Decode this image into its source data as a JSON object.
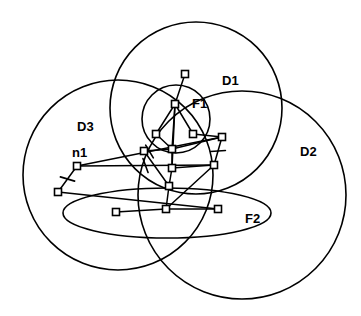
{
  "figure": {
    "width": 361,
    "height": 316,
    "background_color": "#ffffff",
    "stroke_color": "#000000"
  },
  "regions": [
    {
      "id": "D1",
      "label": "D1",
      "shape": "circle",
      "cx": 196,
      "cy": 108,
      "r": 86,
      "label_x": 222,
      "label_y": 82
    },
    {
      "id": "D2",
      "label": "D2",
      "shape": "circle",
      "cx": 242,
      "cy": 195,
      "r": 104,
      "label_x": 300,
      "label_y": 153
    },
    {
      "id": "D3",
      "label": "D3",
      "shape": "circle",
      "cx": 118,
      "cy": 175,
      "r": 95,
      "label_x": 77,
      "label_y": 128
    }
  ],
  "sub_regions": [
    {
      "id": "F1",
      "label": "F1",
      "shape": "circle",
      "cx": 176,
      "cy": 119,
      "r": 34,
      "label_x": 192,
      "label_y": 105
    },
    {
      "id": "F2",
      "label": "F2",
      "shape": "ellipse",
      "cx": 167,
      "cy": 213,
      "rx": 104,
      "ry": 25,
      "label_x": 245,
      "label_y": 220
    }
  ],
  "nodes": [
    {
      "id": "n_top",
      "x": 185,
      "y": 74,
      "size": 7
    },
    {
      "id": "n1_hub",
      "x": 175,
      "y": 104,
      "size": 7
    },
    {
      "id": "n_l1",
      "x": 156,
      "y": 134,
      "size": 7
    },
    {
      "id": "n_r1",
      "x": 193,
      "y": 134,
      "size": 7
    },
    {
      "id": "n_c1",
      "x": 172,
      "y": 149,
      "size": 7
    },
    {
      "id": "n_far_r",
      "x": 222,
      "y": 137,
      "size": 7
    },
    {
      "id": "n_l2",
      "x": 144,
      "y": 151,
      "size": 7
    },
    {
      "id": "n_c2",
      "x": 172,
      "y": 168,
      "size": 7
    },
    {
      "id": "n_r2",
      "x": 214,
      "y": 165,
      "size": 7
    },
    {
      "id": "n1",
      "x": 77,
      "y": 166,
      "size": 7
    },
    {
      "id": "n_ll",
      "x": 58,
      "y": 192,
      "size": 7
    },
    {
      "id": "n_c3",
      "x": 169,
      "y": 186,
      "size": 7
    },
    {
      "id": "n_f2_l",
      "x": 116,
      "y": 212,
      "size": 7
    },
    {
      "id": "n_f2_c",
      "x": 166,
      "y": 209,
      "size": 7
    },
    {
      "id": "n_f2_r",
      "x": 218,
      "y": 209,
      "size": 7
    }
  ],
  "node_labels": [
    {
      "text": "n1",
      "x": 72,
      "y": 154
    }
  ],
  "edges": [
    {
      "from": "n_top",
      "to": "n1_hub",
      "ticks": 0
    },
    {
      "from": "n1_hub",
      "to": "n_l1",
      "ticks": 0
    },
    {
      "from": "n1_hub",
      "to": "n_r1",
      "ticks": 0
    },
    {
      "from": "n1_hub",
      "to": "n_c1",
      "ticks": 0
    },
    {
      "from": "n1_hub",
      "to": "n_c2",
      "ticks": 0
    },
    {
      "from": "n_c1",
      "to": "n_c2",
      "ticks": 0
    },
    {
      "from": "n_l1",
      "to": "n_c1",
      "ticks": 0
    },
    {
      "from": "n_r1",
      "to": "n_far_r",
      "ticks": 0
    },
    {
      "from": "n_c1",
      "to": "n_far_r",
      "ticks": 0
    },
    {
      "from": "n_l2",
      "to": "n_c1",
      "ticks": 0
    },
    {
      "from": "n_far_r",
      "to": "n_r2",
      "ticks": 1
    },
    {
      "from": "n_c2",
      "to": "n_r2",
      "ticks": 0
    },
    {
      "from": "n_c2",
      "to": "n_c3",
      "ticks": 0
    },
    {
      "from": "n1",
      "to": "n_far_r",
      "ticks": 1
    },
    {
      "from": "n1",
      "to": "n_ll",
      "ticks": 1
    },
    {
      "from": "n1",
      "to": "n_r2",
      "ticks": 1
    },
    {
      "from": "n_ll",
      "to": "n_f2_r",
      "ticks": 0
    },
    {
      "from": "n_f2_l",
      "to": "n_f2_c",
      "ticks": 0
    },
    {
      "from": "n_f2_c",
      "to": "n_f2_r",
      "ticks": 0
    },
    {
      "from": "n_f2_c",
      "to": "n_c3",
      "ticks": 0
    },
    {
      "from": "n_f2_c",
      "to": "n_r2",
      "ticks": 0
    },
    {
      "from": "n_c3",
      "to": "n_l2",
      "ticks": 0
    }
  ]
}
